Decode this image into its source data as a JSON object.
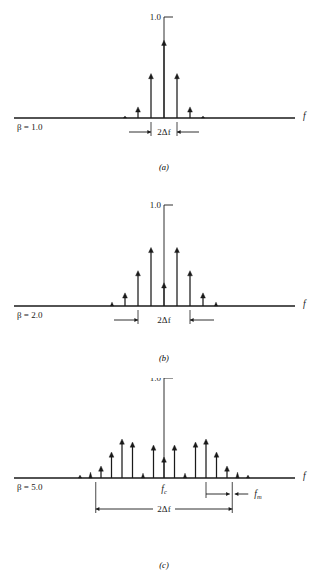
{
  "figure": {
    "type": "line-spectrum-diagram",
    "title": "",
    "background": "#ffffff",
    "ink_color": "#1a1a1a",
    "axis_label": "f",
    "amplitude_label": "1.0"
  },
  "panels": [
    {
      "id": "a",
      "caption": "(a)",
      "beta_label": "β = 1.0",
      "amplitude_tick_label": "1.0",
      "axis_label": "f",
      "annotations": [
        {
          "name": "bandwidth",
          "label": "2Δf",
          "style": "outward-arrows"
        }
      ],
      "baseline_y": 118,
      "center_x": 164,
      "spacing": 13,
      "lines": [
        {
          "index": -3,
          "amplitude": 0.02
        },
        {
          "index": -2,
          "amplitude": 0.11
        },
        {
          "index": -1,
          "amplitude": 0.44
        },
        {
          "index": 0,
          "amplitude": 0.77
        },
        {
          "index": 1,
          "amplitude": 0.44
        },
        {
          "index": 2,
          "amplitude": 0.11
        },
        {
          "index": 3,
          "amplitude": 0.02
        }
      ]
    },
    {
      "id": "b",
      "caption": "(b)",
      "beta_label": "β = 2.0",
      "amplitude_tick_label": "1.0",
      "axis_label": "f",
      "annotations": [
        {
          "name": "bandwidth",
          "label": "2Δf",
          "style": "outward-arrows"
        }
      ],
      "baseline_y": 118,
      "center_x": 164,
      "spacing": 13,
      "lines": [
        {
          "index": -4,
          "amplitude": 0.04
        },
        {
          "index": -3,
          "amplitude": 0.13
        },
        {
          "index": -2,
          "amplitude": 0.35
        },
        {
          "index": -1,
          "amplitude": 0.58
        },
        {
          "index": 0,
          "amplitude": 0.23
        },
        {
          "index": 1,
          "amplitude": 0.58
        },
        {
          "index": 2,
          "amplitude": 0.35
        },
        {
          "index": 3,
          "amplitude": 0.13
        },
        {
          "index": 4,
          "amplitude": 0.04
        }
      ]
    },
    {
      "id": "c",
      "caption": "(c)",
      "beta_label": "β = 5.0",
      "amplitude_tick_label": "1.0",
      "axis_label": "f",
      "annotations": [
        {
          "name": "carrier",
          "label": "fₓ",
          "label_text": "fc",
          "style": "tick-label"
        },
        {
          "name": "modulating-frequency",
          "label": "fm",
          "style": "inward-arrows"
        },
        {
          "name": "bandwidth",
          "label": "2Δf",
          "style": "double-arrow"
        }
      ],
      "baseline_y": 100,
      "center_x": 164,
      "spacing": 10.5,
      "lines": [
        {
          "index": -8,
          "amplitude": 0.03
        },
        {
          "index": -7,
          "amplitude": 0.06
        },
        {
          "index": -6,
          "amplitude": 0.12
        },
        {
          "index": -5,
          "amplitude": 0.26
        },
        {
          "index": -4,
          "amplitude": 0.39
        },
        {
          "index": -3,
          "amplitude": 0.36
        },
        {
          "index": -2,
          "amplitude": 0.05
        },
        {
          "index": -1,
          "amplitude": 0.33
        },
        {
          "index": 0,
          "amplitude": 0.21
        },
        {
          "index": 1,
          "amplitude": 0.33
        },
        {
          "index": 2,
          "amplitude": 0.05
        },
        {
          "index": 3,
          "amplitude": 0.36
        },
        {
          "index": 4,
          "amplitude": 0.39
        },
        {
          "index": 5,
          "amplitude": 0.26
        },
        {
          "index": 6,
          "amplitude": 0.12
        },
        {
          "index": 7,
          "amplitude": 0.06
        },
        {
          "index": 8,
          "amplitude": 0.03
        }
      ]
    }
  ],
  "chart_data": {
    "type": "line-spectrum",
    "title": "",
    "xlabel": "f",
    "ylabel": "",
    "ylim": [
      0,
      1.0
    ],
    "series": [
      {
        "name": "β = 1.0",
        "x": [
          -3,
          -2,
          -1,
          0,
          1,
          2,
          3
        ],
        "values": [
          0.02,
          0.11,
          0.44,
          0.77,
          0.44,
          0.11,
          0.02
        ]
      },
      {
        "name": "β = 2.0",
        "x": [
          -4,
          -3,
          -2,
          -1,
          0,
          1,
          2,
          3,
          4
        ],
        "values": [
          0.04,
          0.13,
          0.35,
          0.58,
          0.23,
          0.58,
          0.35,
          0.13,
          0.04
        ]
      },
      {
        "name": "β = 5.0",
        "x": [
          -8,
          -7,
          -6,
          -5,
          -4,
          -3,
          -2,
          -1,
          0,
          1,
          2,
          3,
          4,
          5,
          6,
          7,
          8
        ],
        "values": [
          0.03,
          0.06,
          0.12,
          0.26,
          0.39,
          0.36,
          0.05,
          0.33,
          0.21,
          0.33,
          0.05,
          0.36,
          0.39,
          0.26,
          0.12,
          0.06,
          0.03
        ]
      }
    ]
  }
}
